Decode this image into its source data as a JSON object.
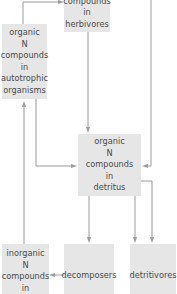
{
  "diagram": {
    "nodes": {
      "herbivores": {
        "lines": [
          "compounds",
          "in",
          "herbivores"
        ]
      },
      "autotrophic": {
        "lines": [
          "organic",
          "N",
          "compounds",
          "in",
          "autotrophic",
          "organisms"
        ]
      },
      "detritus": {
        "lines": [
          "organic",
          "N",
          "compounds",
          "in",
          "detritus"
        ]
      },
      "inorganic": {
        "lines": [
          "inorganic",
          "N",
          "compounds",
          "in"
        ]
      },
      "decomposers": {
        "lines": [
          "decomposers"
        ]
      },
      "detritivores": {
        "lines": [
          "detritivores"
        ]
      }
    },
    "edges": [
      {
        "from": "autotrophic",
        "to": "herbivores"
      },
      {
        "from": "herbivores",
        "to": "detritus"
      },
      {
        "from": "autotrophic",
        "to": "detritus"
      },
      {
        "from": "top-right",
        "to": "detritus"
      },
      {
        "from": "detritus",
        "to": "decomposers"
      },
      {
        "from": "detritus",
        "to": "detritivores"
      },
      {
        "from": "decomposers",
        "to": "inorganic"
      },
      {
        "from": "inorganic",
        "to": "autotrophic"
      }
    ],
    "colors": {
      "box": "#e6e6e6",
      "line": "#9a9a9a",
      "text": "#4a4a4a"
    }
  }
}
